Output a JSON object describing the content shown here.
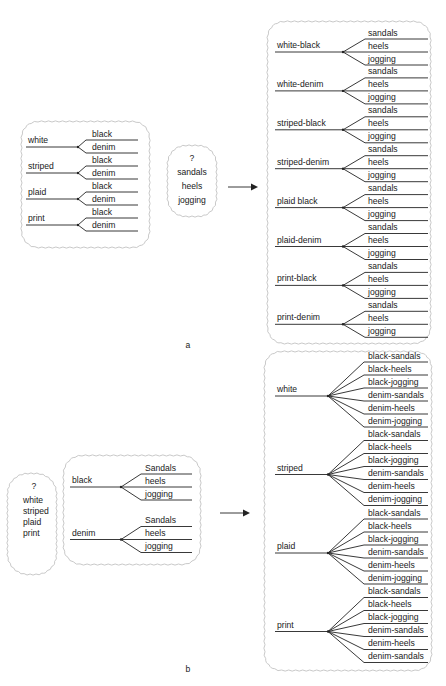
{
  "panel_a": {
    "caption": "a",
    "left_tree": {
      "first_items": [
        "white",
        "striped",
        "plaid",
        "print"
      ],
      "second_items": [
        "black",
        "denim"
      ]
    },
    "unknown_set": {
      "marker": "?",
      "items": [
        "sandals",
        "heels",
        "jogging"
      ]
    },
    "result_tree": {
      "groups": [
        {
          "label": "white-black",
          "children": [
            "sandals",
            "heels",
            "jogging"
          ]
        },
        {
          "label": "white-denim",
          "children": [
            "sandals",
            "heels",
            "jogging"
          ]
        },
        {
          "label": "striped-black",
          "children": [
            "sandals",
            "heels",
            "jogging"
          ]
        },
        {
          "label": "striped-denim",
          "children": [
            "sandals",
            "heels",
            "jogging"
          ]
        },
        {
          "label": "plaid black",
          "children": [
            "sandals",
            "heels",
            "jogging"
          ]
        },
        {
          "label": "plaid-denim",
          "children": [
            "sandals",
            "heels",
            "jogging"
          ]
        },
        {
          "label": "print-black",
          "children": [
            "sandals",
            "heels",
            "jogging"
          ]
        },
        {
          "label": "print-denim",
          "children": [
            "sandals",
            "heels",
            "jogging"
          ]
        }
      ]
    }
  },
  "panel_b": {
    "caption": "b",
    "unknown_set": {
      "marker": "?",
      "items": [
        "white",
        "striped",
        "plaid",
        "print"
      ]
    },
    "left_tree": {
      "groups": [
        {
          "label": "black",
          "children": [
            "Sandals",
            "heels",
            "jogging"
          ]
        },
        {
          "label": "denim",
          "children": [
            "Sandals",
            "heels",
            "jogging"
          ]
        }
      ]
    },
    "result_tree": {
      "groups": [
        {
          "label": "white",
          "children": [
            "black-sandals",
            "black-heels",
            "black-jogging",
            "denim-sandals",
            "denim-heels",
            "denim-jogging"
          ]
        },
        {
          "label": "striped",
          "children": [
            "black-sandals",
            "black-heels",
            "black-jogging",
            "denim-sandals",
            "denim-heels",
            "denim-jogging"
          ]
        },
        {
          "label": "plaid",
          "children": [
            "black-sandals",
            "black-heels",
            "black-jogging",
            "denim-sandals",
            "denim-heels",
            "denim-jogging"
          ]
        },
        {
          "label": "print",
          "children": [
            "black-sandals",
            "black-heels",
            "black-jogging",
            "denim-sandals",
            "denim-heels",
            "denim-sandals"
          ]
        }
      ]
    }
  },
  "colors": {
    "ink": "#222222",
    "cloud_outline": "#c9c9c9",
    "background": "#ffffff"
  }
}
